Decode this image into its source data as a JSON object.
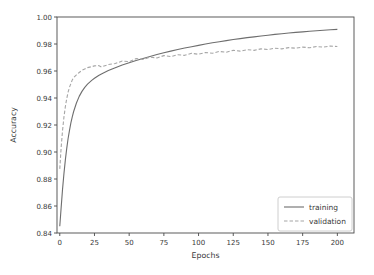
{
  "figure": {
    "background": "#ffffff",
    "axis_color": "#4a4a4a",
    "tick_text_color": "#3a3a3a"
  },
  "chart_data": {
    "type": "line",
    "title": "",
    "xlabel": "Epochs",
    "ylabel": "Accuracy",
    "xlim": [
      -2,
      212
    ],
    "ylim": [
      0.84,
      1.0
    ],
    "xticks": [
      0,
      25,
      50,
      75,
      100,
      125,
      150,
      175,
      200
    ],
    "yticks": [
      0.84,
      0.86,
      0.88,
      0.9,
      0.92,
      0.94,
      0.96,
      0.98,
      1.0
    ],
    "grid": false,
    "legend": {
      "position": "lower right"
    },
    "series": [
      {
        "name": "training",
        "style": "solid",
        "color": "#6e6e6e",
        "points": [
          [
            0,
            0.845
          ],
          [
            1,
            0.859
          ],
          [
            2,
            0.8725
          ],
          [
            3,
            0.884
          ],
          [
            4,
            0.894
          ],
          [
            5,
            0.9025
          ],
          [
            6,
            0.91
          ],
          [
            7,
            0.916
          ],
          [
            8,
            0.9215
          ],
          [
            9,
            0.926
          ],
          [
            10,
            0.93
          ],
          [
            12,
            0.9363
          ],
          [
            14,
            0.9412
          ],
          [
            16,
            0.9449
          ],
          [
            18,
            0.9479
          ],
          [
            20,
            0.9503
          ],
          [
            23,
            0.9531
          ],
          [
            25,
            0.9546
          ],
          [
            28,
            0.9567
          ],
          [
            30,
            0.9578
          ],
          [
            35,
            0.9603
          ],
          [
            40,
            0.9624
          ],
          [
            45,
            0.9644
          ],
          [
            50,
            0.9661
          ],
          [
            55,
            0.9677
          ],
          [
            60,
            0.9693
          ],
          [
            65,
            0.9708
          ],
          [
            70,
            0.9722
          ],
          [
            75,
            0.9735
          ],
          [
            80,
            0.9747
          ],
          [
            85,
            0.9759
          ],
          [
            90,
            0.977
          ],
          [
            95,
            0.978
          ],
          [
            100,
            0.979
          ],
          [
            105,
            0.98
          ],
          [
            110,
            0.9809
          ],
          [
            115,
            0.9817
          ],
          [
            120,
            0.9825
          ],
          [
            125,
            0.9833
          ],
          [
            130,
            0.984
          ],
          [
            135,
            0.9847
          ],
          [
            140,
            0.9853
          ],
          [
            145,
            0.9859
          ],
          [
            150,
            0.9865
          ],
          [
            155,
            0.9871
          ],
          [
            160,
            0.9876
          ],
          [
            165,
            0.9881
          ],
          [
            170,
            0.9886
          ],
          [
            175,
            0.989
          ],
          [
            180,
            0.9894
          ],
          [
            185,
            0.9898
          ],
          [
            190,
            0.9902
          ],
          [
            195,
            0.9905
          ],
          [
            200,
            0.9908
          ]
        ]
      },
      {
        "name": "validation",
        "style": "dashed",
        "color": "#a6a6a6",
        "points": [
          [
            0,
            0.8875
          ],
          [
            1,
            0.9035
          ],
          [
            2,
            0.916
          ],
          [
            3,
            0.9258
          ],
          [
            4,
            0.9335
          ],
          [
            5,
            0.9395
          ],
          [
            6,
            0.9443
          ],
          [
            7,
            0.948
          ],
          [
            8,
            0.9507
          ],
          [
            9,
            0.9534
          ],
          [
            10,
            0.9551
          ],
          [
            12,
            0.9572
          ],
          [
            14,
            0.9589
          ],
          [
            16,
            0.9605
          ],
          [
            18,
            0.9615
          ],
          [
            20,
            0.9625
          ],
          [
            23,
            0.9632
          ],
          [
            25,
            0.9638
          ],
          [
            28,
            0.964
          ],
          [
            30,
            0.963
          ],
          [
            35,
            0.9648
          ],
          [
            40,
            0.9655
          ],
          [
            45,
            0.9674
          ],
          [
            50,
            0.9669
          ],
          [
            55,
            0.9692
          ],
          [
            60,
            0.9686
          ],
          [
            65,
            0.9702
          ],
          [
            70,
            0.9697
          ],
          [
            75,
            0.9714
          ],
          [
            80,
            0.9707
          ],
          [
            85,
            0.972
          ],
          [
            90,
            0.9716
          ],
          [
            95,
            0.9731
          ],
          [
            100,
            0.9724
          ],
          [
            105,
            0.9737
          ],
          [
            110,
            0.9732
          ],
          [
            115,
            0.9745
          ],
          [
            120,
            0.9739
          ],
          [
            125,
            0.9753
          ],
          [
            130,
            0.9747
          ],
          [
            135,
            0.9758
          ],
          [
            140,
            0.9753
          ],
          [
            145,
            0.9764
          ],
          [
            150,
            0.9759
          ],
          [
            155,
            0.9769
          ],
          [
            160,
            0.9764
          ],
          [
            165,
            0.9773
          ],
          [
            170,
            0.9769
          ],
          [
            175,
            0.9777
          ],
          [
            180,
            0.9772
          ],
          [
            185,
            0.9781
          ],
          [
            190,
            0.9777
          ],
          [
            195,
            0.9785
          ],
          [
            200,
            0.9781
          ]
        ]
      }
    ]
  }
}
